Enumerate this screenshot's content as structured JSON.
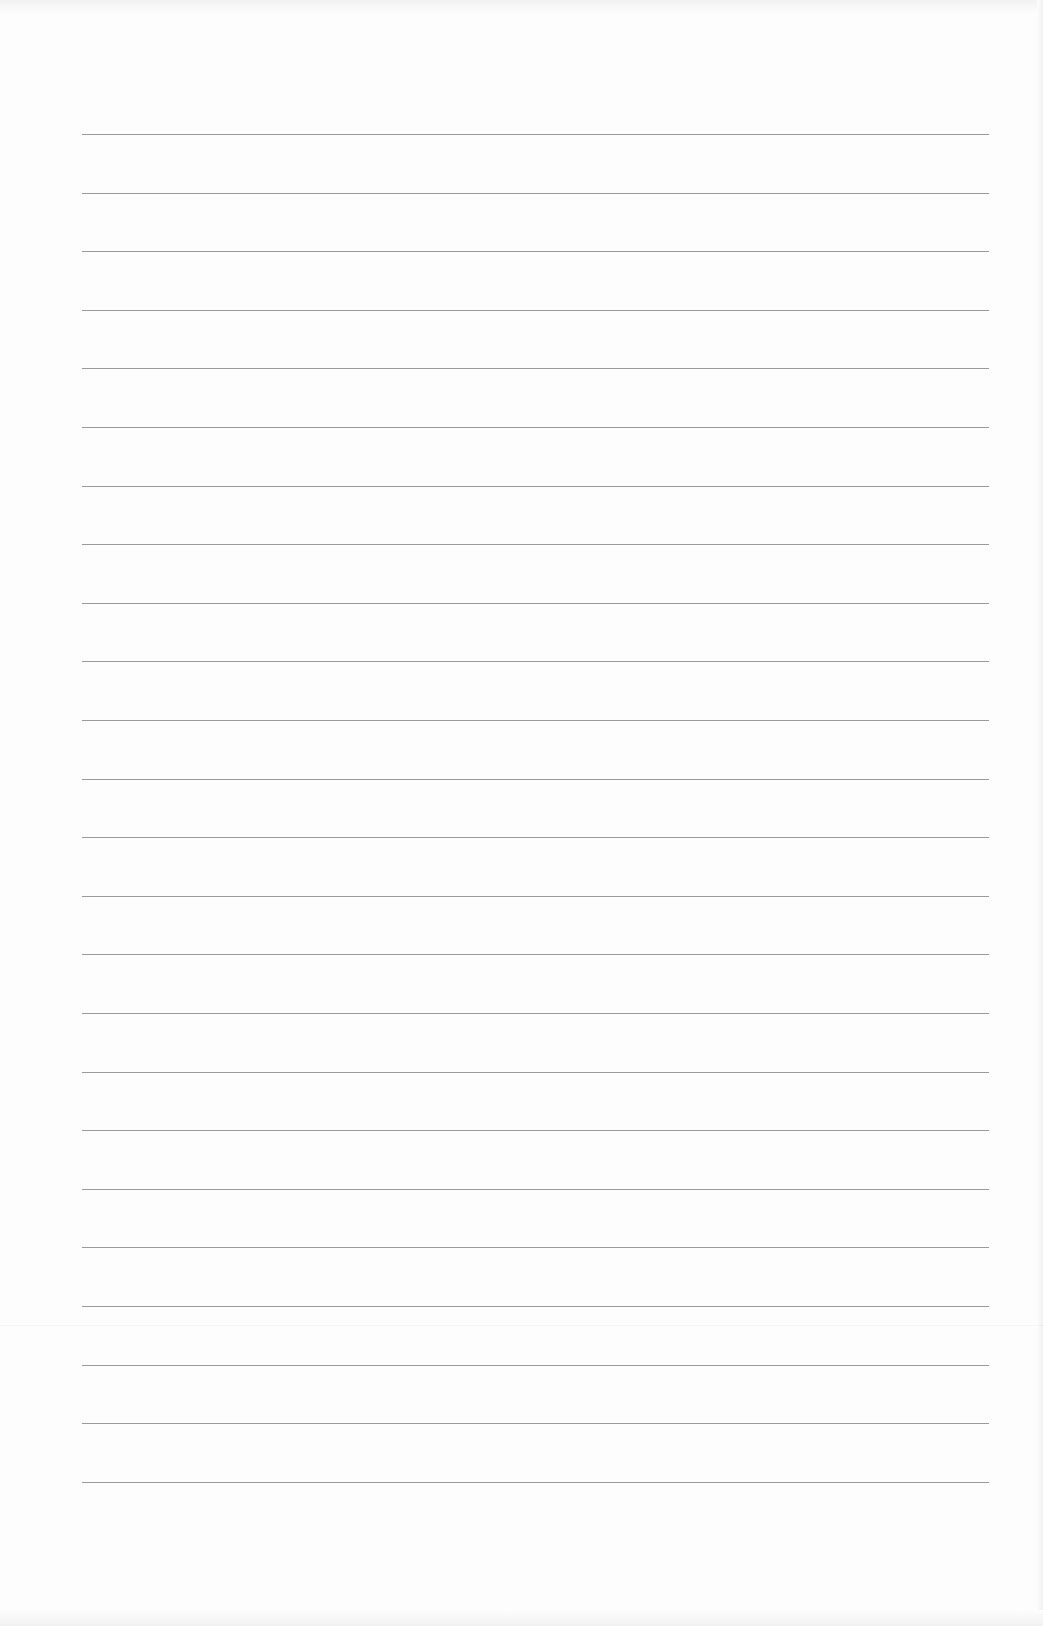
{
  "page": {
    "type": "blank lined paper",
    "line_count": 24,
    "first_line_y": 134,
    "line_spacing": 58.6,
    "line_left": 82,
    "line_width": 907,
    "line_color": "#9a9a9a",
    "background_color": "#fdfdfd"
  }
}
